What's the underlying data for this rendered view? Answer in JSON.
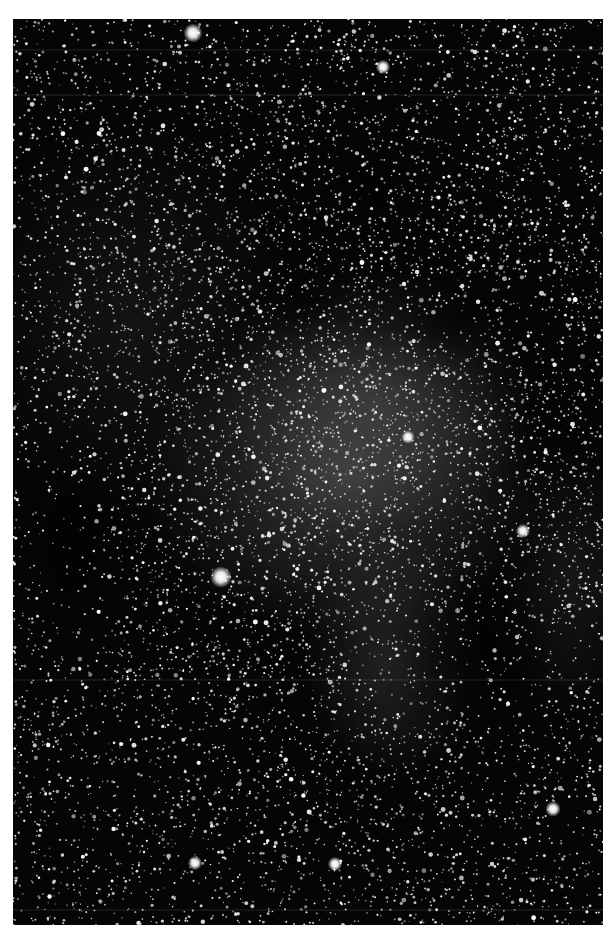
{
  "image": {
    "description": "Black and white astronomical photograph of a dense Milky Way star field with faint diffuse nebulosity and dark dust lanes",
    "subject": "star-field-with-nebula",
    "frame": {
      "left": 13,
      "top": 19,
      "width": 590,
      "height": 906
    },
    "colors": {
      "page_background": "#ffffff",
      "sky_background": "#050505",
      "nebula_glow": "#8a8a8a",
      "star": "#ffffff"
    },
    "nebula_regions": [
      {
        "cx": 330,
        "cy": 460,
        "rx": 200,
        "ry": 160,
        "intensity": 0.35
      },
      {
        "cx": 360,
        "cy": 380,
        "rx": 160,
        "ry": 130,
        "intensity": 0.25
      },
      {
        "cx": 380,
        "cy": 640,
        "rx": 90,
        "ry": 120,
        "intensity": 0.22
      },
      {
        "cx": 560,
        "cy": 560,
        "rx": 70,
        "ry": 140,
        "intensity": 0.12
      },
      {
        "cx": 120,
        "cy": 300,
        "rx": 160,
        "ry": 200,
        "intensity": 0.1
      }
    ],
    "dark_lanes": [
      {
        "cx": 290,
        "cy": 280,
        "rx": 40,
        "ry": 30
      },
      {
        "cx": 440,
        "cy": 300,
        "rx": 60,
        "ry": 40
      },
      {
        "cx": 450,
        "cy": 640,
        "rx": 90,
        "ry": 90
      },
      {
        "cx": 360,
        "cy": 170,
        "rx": 40,
        "ry": 40
      },
      {
        "cx": 60,
        "cy": 520,
        "rx": 60,
        "ry": 120
      }
    ],
    "bright_stars": [
      {
        "x": 208,
        "y": 558,
        "r": 4.5
      },
      {
        "x": 180,
        "y": 14,
        "r": 4
      },
      {
        "x": 370,
        "y": 48,
        "r": 3
      },
      {
        "x": 510,
        "y": 512,
        "r": 3
      },
      {
        "x": 395,
        "y": 418,
        "r": 2.8
      },
      {
        "x": 540,
        "y": 790,
        "r": 3.2
      },
      {
        "x": 182,
        "y": 844,
        "r": 3
      },
      {
        "x": 322,
        "y": 845,
        "r": 3
      }
    ],
    "star_count": 9000,
    "seed": 1337
  }
}
